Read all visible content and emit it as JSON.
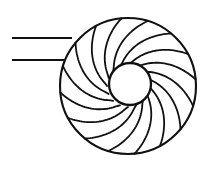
{
  "figure": {
    "type": "line-drawing",
    "background_color": "#ffffff",
    "stroke_color": "#111111",
    "canvas": {
      "width": 215,
      "height": 173
    }
  },
  "diagram_data": {
    "type": "technical-line-drawing",
    "subject": "impeller-with-curved-blades",
    "outer_rim": {
      "name": "outer-rim-circle",
      "cx": 128,
      "cy": 86,
      "r": 68,
      "stroke_width": 2.1
    },
    "hub": {
      "name": "hub-circle",
      "cx": 130,
      "cy": 84,
      "r": 21,
      "stroke_width": 2.3,
      "fill": "#ffffff"
    },
    "blades": {
      "count": 16,
      "curvature": "backward-swept",
      "rotation_sense": "clockwise",
      "start_radius": 21,
      "end_radius": 68,
      "sweep_degrees": 62,
      "stroke_width": 1.8,
      "angles_deg": [
        0,
        22.5,
        45,
        67.5,
        90,
        112.5,
        135,
        157.5,
        180,
        202.5,
        225,
        247.5,
        270,
        292.5,
        315,
        337.5
      ]
    },
    "lead_lines": [
      {
        "name": "upper-lead-line",
        "x1": 12,
        "y1": 38,
        "x2": 72,
        "y2": 38,
        "stroke_width": 2.0
      },
      {
        "name": "lower-lead-line",
        "x1": 12,
        "y1": 60,
        "x2": 64,
        "y2": 60,
        "stroke_width": 2.0
      }
    ]
  }
}
